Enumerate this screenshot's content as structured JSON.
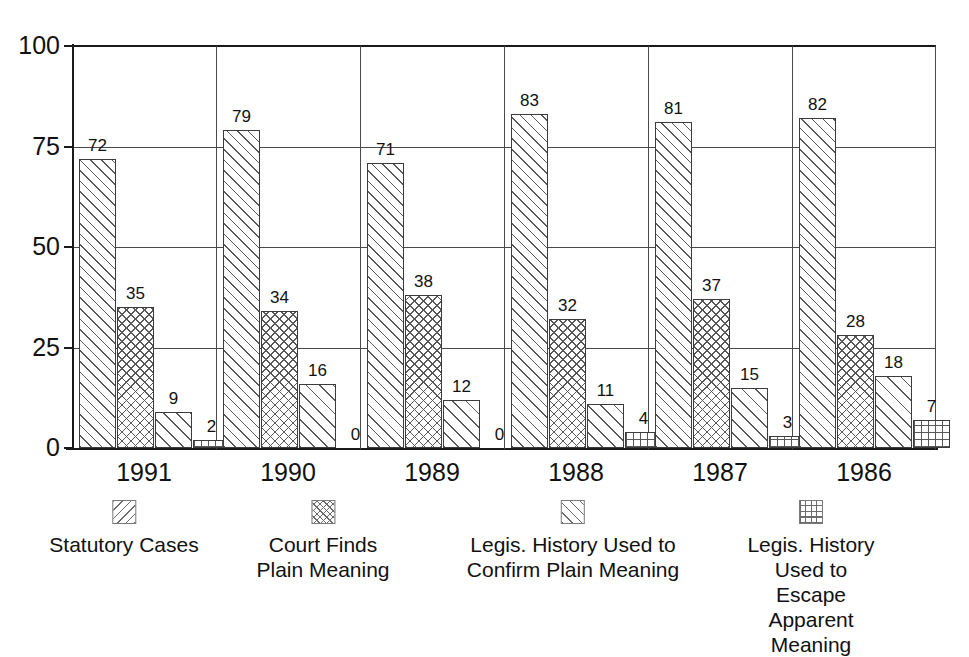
{
  "chart_data": {
    "type": "bar",
    "title": "",
    "subtitle": "",
    "xlabel": "",
    "ylabel": "",
    "ylim": [
      0,
      100
    ],
    "yticks": [
      "0",
      "25",
      "50",
      "75",
      "100"
    ],
    "grid": "horizontal-and-group-separators",
    "legend_position": "bottom",
    "categories": [
      "1991",
      "1990",
      "1989",
      "1988",
      "1987",
      "1986"
    ],
    "series": [
      {
        "name": "Statutory Cases",
        "pattern": "diagonal-hatch",
        "values": [
          72,
          79,
          71,
          83,
          81,
          82
        ],
        "labels": [
          "72",
          "79",
          "71",
          "83",
          "81",
          "82"
        ]
      },
      {
        "name": "Court Finds\nPlain Meaning",
        "pattern": "cross-hatch",
        "values": [
          35,
          34,
          38,
          32,
          37,
          28
        ],
        "labels": [
          "35",
          "34",
          "38",
          "32",
          "37",
          "28"
        ]
      },
      {
        "name": "Legis. History Used to\nConfirm Plain Meaning",
        "pattern": "diagonal-hatch-wide",
        "values": [
          9,
          16,
          12,
          11,
          15,
          18
        ],
        "labels": [
          "9",
          "16",
          "12",
          "11",
          "15",
          "18"
        ]
      },
      {
        "name": "Legis. History Used to\nEscape Apparent Meaning",
        "pattern": "grid-hatch",
        "values": [
          2,
          0,
          0,
          4,
          3,
          7
        ],
        "labels": [
          "2",
          "0",
          "0",
          "4",
          "3",
          "7"
        ]
      }
    ]
  },
  "axis": {
    "ticks": [
      {
        "value": 100,
        "label": "100"
      },
      {
        "value": 75,
        "label": "75"
      },
      {
        "value": 50,
        "label": "50"
      },
      {
        "value": 25,
        "label": "25"
      },
      {
        "value": 0,
        "label": "0"
      }
    ]
  },
  "legend": {
    "items": [
      {
        "label": "Statutory Cases",
        "swatch": "diagonal-hatch-swatch"
      },
      {
        "label": "Court Finds\nPlain Meaning",
        "swatch": "cross-hatch-swatch"
      },
      {
        "label": "Legis. History Used to\nConfirm Plain Meaning",
        "swatch": "diagonal-hatch-wide-swatch"
      },
      {
        "label": "Legis. History Used to\nEscape Apparent Meaning",
        "swatch": "grid-hatch-swatch"
      }
    ]
  },
  "colors": {
    "axis": "#1a1a1a",
    "grid": "#4a4a4a",
    "bar_outline": "#3c3c3c",
    "hatch": "#585858",
    "background": "#ffffff",
    "text": "#111111"
  }
}
